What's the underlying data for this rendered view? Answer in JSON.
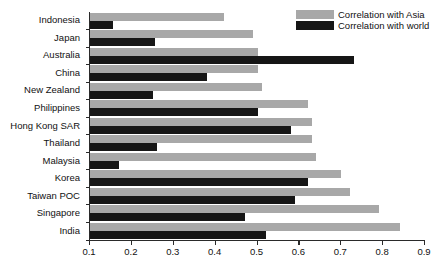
{
  "chart_data": {
    "type": "bar",
    "orientation": "horizontal",
    "title": "",
    "xlabel": "",
    "ylabel": "",
    "xlim": [
      0.1,
      0.9
    ],
    "xticks": [
      "0.1",
      "0.2",
      "0.3",
      "0.4",
      "0.5",
      "0.6",
      "0.7",
      "0.8",
      "0.9"
    ],
    "grid": false,
    "legend_position": "top-right",
    "categories": [
      "Indonesia",
      "Japan",
      "Australia",
      "China",
      "New Zealand",
      "Philippines",
      "Hong Kong SAR",
      "Thailand",
      "Malaysia",
      "Korea",
      "Taiwan POC",
      "Singapore",
      "India"
    ],
    "series": [
      {
        "name": "Correlation with Asia",
        "color": "#a8a8a8",
        "values": [
          0.42,
          0.49,
          0.5,
          0.5,
          0.51,
          0.62,
          0.63,
          0.63,
          0.64,
          0.7,
          0.72,
          0.79,
          0.84
        ]
      },
      {
        "name": "Correlation with world",
        "color": "#161616",
        "values": [
          0.155,
          0.255,
          0.73,
          0.38,
          0.25,
          0.5,
          0.58,
          0.26,
          0.17,
          0.62,
          0.59,
          0.47,
          0.52
        ]
      }
    ]
  }
}
